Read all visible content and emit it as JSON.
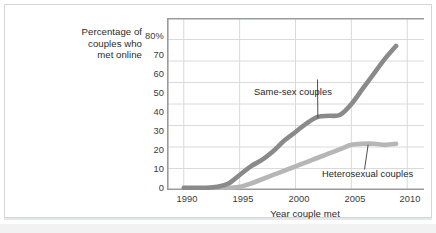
{
  "figure": {
    "y_axis_title": "Percentage of couples who met online",
    "y_axis_title_line1": "Percentage of",
    "y_axis_title_line2": "couples who",
    "y_axis_title_line3": "met online",
    "x_axis_title": "Year couple met",
    "annotation_samesex": "Same-sex couples",
    "annotation_hetero": "Heterosexual couples",
    "colors": {
      "samesex_line": "#8a8a8a",
      "hetero_line": "#b6b6b6",
      "gridline": "#d9dadc",
      "axis": "#9a9b9d",
      "text": "#2b2b2b",
      "frame": "#d5d6d8",
      "background": "#ffffff"
    }
  },
  "chart_data": {
    "type": "line",
    "title": "",
    "subtitle": "",
    "xlabel": "Year couple met",
    "ylabel": "Percentage of couples who met online",
    "xlim": [
      1988.5,
      2011.5
    ],
    "ylim": [
      0,
      80
    ],
    "grid": true,
    "legend_position": "inline-annotations",
    "xticks": [
      1990,
      1995,
      2000,
      2005,
      2010
    ],
    "xtick_labels": [
      "1990",
      "1995",
      "2000",
      "2005",
      "2010"
    ],
    "yticks": [
      0,
      10,
      20,
      30,
      40,
      50,
      60,
      70,
      80
    ],
    "ytick_labels": [
      "0",
      "10",
      "20",
      "30",
      "40",
      "50",
      "60",
      "70",
      "80%"
    ],
    "x": [
      1990,
      1991,
      1992,
      1993,
      1994,
      1995,
      1996,
      1997,
      1998,
      1999,
      2000,
      2001,
      2002,
      2003,
      2004,
      2005,
      2006,
      2007,
      2008,
      2009
    ],
    "series": [
      {
        "name": "Same-sex couples",
        "color": "#8a8a8a",
        "values": [
          1,
          1,
          1,
          1.5,
          3,
          7,
          11,
          14,
          18,
          23,
          27,
          31,
          34,
          34.5,
          35,
          40,
          47,
          54,
          61,
          67
        ]
      },
      {
        "name": "Heterosexual couples",
        "color": "#b6b6b6",
        "values": [
          0.5,
          0.5,
          0.5,
          0.8,
          1,
          1.5,
          3,
          5,
          7,
          9,
          11,
          13,
          15,
          17,
          19,
          21,
          21.5,
          21.5,
          21,
          21.5
        ]
      }
    ],
    "annotations": [
      {
        "text": "Same-sex couples",
        "target_x": 2002,
        "target_y": 34,
        "label_x": 2000,
        "label_y": 50
      },
      {
        "text": "Heterosexual couples",
        "target_x": 2006.5,
        "target_y": 21.5,
        "label_x": 2006,
        "label_y": 10
      }
    ]
  }
}
